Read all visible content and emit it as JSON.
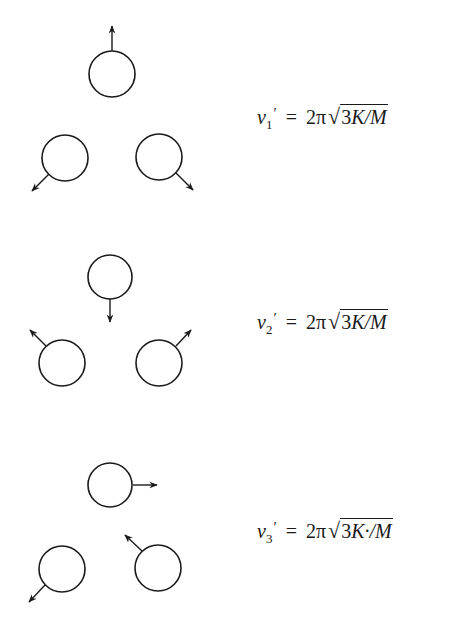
{
  "colors": {
    "ink": "#1a1a1a",
    "background": "#ffffff"
  },
  "modes": [
    {
      "label": "mode-1",
      "formula": {
        "symbol": "v",
        "subscript": "1",
        "prime": "′",
        "equals": "=",
        "coefficient": "2π",
        "sqrt_symbol": "√",
        "radicand_number": "3",
        "radicand_rest": "K/M"
      },
      "masses": [
        {
          "cx": 112,
          "cy": 74,
          "r": 23,
          "arrow": {
            "x1": 112,
            "y1": 51,
            "x2": 112,
            "y2": 26
          }
        },
        {
          "cx": 65,
          "cy": 158,
          "r": 23,
          "arrow": {
            "x1": 49,
            "y1": 174,
            "x2": 32,
            "y2": 191
          }
        },
        {
          "cx": 159,
          "cy": 157,
          "r": 23,
          "arrow": {
            "x1": 176,
            "y1": 173,
            "x2": 193,
            "y2": 190
          }
        }
      ]
    },
    {
      "label": "mode-2",
      "formula": {
        "symbol": "v",
        "subscript": "2",
        "prime": "′",
        "equals": "=",
        "coefficient": "2π",
        "sqrt_symbol": "√",
        "radicand_number": "3",
        "radicand_rest": "K/M"
      },
      "masses": [
        {
          "cx": 110,
          "cy": 277,
          "r": 22,
          "arrow": {
            "x1": 110,
            "y1": 299,
            "x2": 110,
            "y2": 322
          }
        },
        {
          "cx": 62,
          "cy": 363,
          "r": 23,
          "arrow": {
            "x1": 46,
            "y1": 346,
            "x2": 30,
            "y2": 330
          }
        },
        {
          "cx": 159,
          "cy": 363,
          "r": 23,
          "arrow": {
            "x1": 176,
            "y1": 346,
            "x2": 191,
            "y2": 330
          }
        }
      ]
    },
    {
      "label": "mode-3",
      "formula": {
        "symbol": "v",
        "subscript": "3",
        "prime": "′",
        "equals": "=",
        "coefficient": "2π",
        "sqrt_symbol": "√",
        "radicand_number": "3",
        "radicand_rest": "K·/M"
      },
      "masses": [
        {
          "cx": 110,
          "cy": 485,
          "r": 22,
          "arrow": {
            "x1": 133,
            "y1": 485,
            "x2": 157,
            "y2": 485
          }
        },
        {
          "cx": 62,
          "cy": 569,
          "r": 23,
          "arrow": {
            "x1": 45,
            "y1": 585,
            "x2": 29,
            "y2": 602
          }
        },
        {
          "cx": 158,
          "cy": 568,
          "r": 23,
          "arrow": {
            "x1": 142,
            "y1": 551,
            "x2": 125,
            "y2": 535
          }
        }
      ]
    }
  ]
}
